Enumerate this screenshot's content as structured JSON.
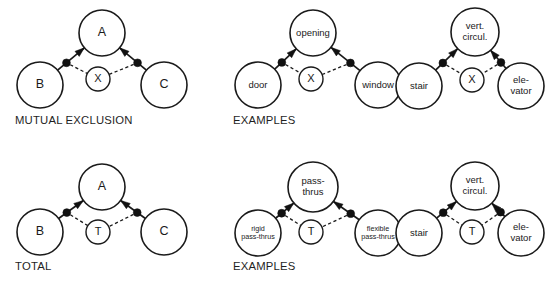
{
  "figure": {
    "background_color": "#ffffff",
    "stroke_color": "#1a1a1a"
  },
  "panels": [
    {
      "id": "mutual-exclusion-abstract",
      "caption": "MUTUAL EXCLUSION",
      "caption_x": 15,
      "caption_y": 121,
      "relation_symbol": "X",
      "nodes": {
        "top": {
          "label": "A",
          "cx": 102,
          "cy": 33,
          "r": 23,
          "label_size": "label-lg",
          "lines": [
            "A"
          ]
        },
        "left": {
          "label": "B",
          "cx": 40,
          "cy": 85,
          "r": 23,
          "label_size": "label-lg",
          "lines": [
            "B"
          ]
        },
        "right": {
          "label": "C",
          "cx": 164,
          "cy": 85,
          "r": 23,
          "label_size": "label-lg",
          "lines": [
            "C"
          ]
        },
        "center": {
          "label": "X",
          "cx": 98,
          "cy": 79,
          "r": 12,
          "label_size": "label-md",
          "lines": [
            "X"
          ]
        }
      }
    },
    {
      "id": "mutual-exclusion-examples",
      "caption": "EXAMPLES",
      "caption_x": 233,
      "caption_y": 121,
      "relation_symbol": "X",
      "nodes": {
        "top": {
          "label": "opening",
          "cx": 313,
          "cy": 33,
          "r": 23,
          "label_size": "label-sm",
          "lines": [
            "opening"
          ]
        },
        "left": {
          "label": "door",
          "cx": 258,
          "cy": 85,
          "r": 23,
          "label_size": "label-sm",
          "lines": [
            "door"
          ]
        },
        "right": {
          "label": "window",
          "cx": 378,
          "cy": 85,
          "r": 23,
          "label_size": "label-sm",
          "lines": [
            "window"
          ]
        },
        "center": {
          "label": "X",
          "cx": 311,
          "cy": 79,
          "r": 12,
          "label_size": "label-md",
          "lines": [
            "X"
          ]
        }
      }
    },
    {
      "id": "mutual-exclusion-circulation",
      "caption": "",
      "caption_x": 0,
      "caption_y": 0,
      "relation_symbol": "X",
      "nodes": {
        "top": {
          "label": "vert. circul.",
          "cx": 475,
          "cy": 32,
          "r": 24,
          "label_size": "label-sm",
          "lines": [
            "vert.",
            "circul."
          ]
        },
        "left": {
          "label": "stair",
          "cx": 419,
          "cy": 86,
          "r": 23,
          "label_size": "label-sm",
          "lines": [
            "stair"
          ]
        },
        "right": {
          "label": "elevator",
          "cx": 521,
          "cy": 86,
          "r": 23,
          "label_size": "label-sm",
          "lines": [
            "ele-",
            "vator"
          ]
        },
        "center": {
          "label": "X",
          "cx": 472,
          "cy": 80,
          "r": 12,
          "label_size": "label-md",
          "lines": [
            "X"
          ]
        }
      }
    },
    {
      "id": "total-abstract",
      "caption": "TOTAL",
      "caption_x": 15,
      "caption_y": 267,
      "relation_symbol": "T",
      "nodes": {
        "top": {
          "label": "A",
          "cx": 102,
          "cy": 187,
          "r": 23,
          "label_size": "label-lg",
          "lines": [
            "A"
          ]
        },
        "left": {
          "label": "B",
          "cx": 40,
          "cy": 232,
          "r": 23,
          "label_size": "label-lg",
          "lines": [
            "B"
          ]
        },
        "right": {
          "label": "C",
          "cx": 164,
          "cy": 232,
          "r": 23,
          "label_size": "label-lg",
          "lines": [
            "C"
          ]
        },
        "center": {
          "label": "T",
          "cx": 98,
          "cy": 232,
          "r": 12,
          "label_size": "label-md",
          "lines": [
            "T"
          ]
        }
      }
    },
    {
      "id": "total-examples",
      "caption": "EXAMPLES",
      "caption_x": 233,
      "caption_y": 267,
      "relation_symbol": "T",
      "nodes": {
        "top": {
          "label": "pass-thrus",
          "cx": 313,
          "cy": 187,
          "r": 25,
          "label_size": "label-sm",
          "lines": [
            "pass-",
            "thrus"
          ]
        },
        "left": {
          "label": "rigid pass-thrus",
          "cx": 258,
          "cy": 233,
          "r": 23,
          "label_size": "label-xs",
          "lines": [
            "rigid",
            "pass-thrus"
          ]
        },
        "right": {
          "label": "flexible pass-thrus",
          "cx": 378,
          "cy": 233,
          "r": 23,
          "label_size": "label-xs",
          "lines": [
            "flexible",
            "pass-thrus"
          ]
        },
        "center": {
          "label": "T",
          "cx": 311,
          "cy": 232,
          "r": 12,
          "label_size": "label-md",
          "lines": [
            "T"
          ]
        }
      }
    },
    {
      "id": "total-circulation",
      "caption": "",
      "caption_x": 0,
      "caption_y": 0,
      "relation_symbol": "T",
      "nodes": {
        "top": {
          "label": "vert. circul.",
          "cx": 475,
          "cy": 186,
          "r": 24,
          "label_size": "label-sm",
          "lines": [
            "vert.",
            "circul."
          ]
        },
        "left": {
          "label": "stair",
          "cx": 419,
          "cy": 233,
          "r": 23,
          "label_size": "label-sm",
          "lines": [
            "stair"
          ]
        },
        "right": {
          "label": "elevator",
          "cx": 521,
          "cy": 233,
          "r": 23,
          "label_size": "label-sm",
          "lines": [
            "ele-",
            "vator"
          ]
        },
        "center": {
          "label": "T",
          "cx": 472,
          "cy": 232,
          "r": 12,
          "label_size": "label-md",
          "lines": [
            "T"
          ]
        }
      }
    }
  ],
  "legend": {
    "solid_edge": "subtype link with junction dot and arrowhead toward supertype",
    "dashed_edge": "relation constraint link to constraint marker"
  }
}
